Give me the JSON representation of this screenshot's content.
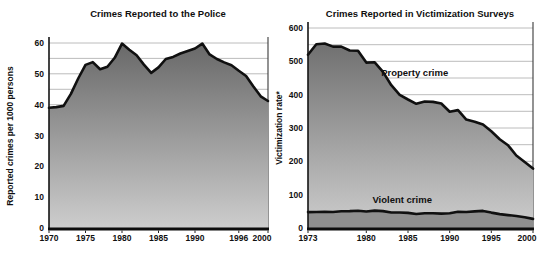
{
  "figure": {
    "background": "#ffffff"
  },
  "chart_data": [
    {
      "type": "area",
      "title": "Crimes Reported to the Police",
      "ylabel": "Reported crimes per 1000 persons",
      "xlabel": "",
      "x_range": [
        1970,
        2000
      ],
      "ylim": [
        0,
        60
      ],
      "y_ticks": [
        0,
        10,
        20,
        30,
        40,
        50,
        60
      ],
      "x_ticks": [
        1970,
        1975,
        1980,
        1985,
        1990,
        1996,
        2000
      ],
      "grid_step": 5,
      "grid_on": true,
      "grid_color": "#b4b4b4",
      "line_color": "#101010",
      "axis_color": "#0d0d0d",
      "series": [
        {
          "name": "Reported crimes",
          "x_start": 1970,
          "values": [
            39.0,
            39.2,
            39.6,
            43.5,
            48.5,
            52.9,
            53.8,
            51.5,
            52.3,
            55.2,
            59.8,
            57.8,
            56.0,
            53.0,
            50.3,
            52.1,
            54.8,
            55.5,
            56.6,
            57.4,
            58.2,
            59.8,
            56.3,
            54.8,
            53.7,
            52.8,
            51.0,
            49.3,
            45.9,
            42.7,
            41.2
          ],
          "fill": {
            "kind": "gradient",
            "top": "#686868",
            "bottom": "#cdcdcd"
          }
        }
      ],
      "annotations": []
    },
    {
      "type": "area",
      "title": "Crimes Reported in Victimization Surveys",
      "ylabel": "Victimization rate*",
      "xlabel": "",
      "x_range": [
        1973,
        2000
      ],
      "ylim": [
        0,
        600
      ],
      "y_ticks": [
        0,
        100,
        200,
        300,
        400,
        500,
        600
      ],
      "x_ticks": [
        1973,
        1980,
        1985,
        1990,
        1995,
        2000
      ],
      "grid_step": 50,
      "grid_on": true,
      "grid_color": "#b4b4b4",
      "line_color": "#101010",
      "axis_color": "#0d0d0d",
      "series": [
        {
          "name": "Property crime",
          "x_start": 1973,
          "values": [
            519.9,
            551.5,
            553.6,
            544.2,
            544.1,
            532.6,
            531.8,
            496.1,
            497.2,
            468.3,
            428.4,
            399.2,
            385.4,
            372.7,
            379.6,
            378.4,
            373.4,
            348.9,
            353.7,
            325.3,
            318.9,
            310.2,
            290.5,
            266.3,
            248.3,
            217.4,
            198.0,
            178.1
          ],
          "fill": {
            "kind": "gradient",
            "top": "#686868",
            "bottom": "#cdcdcd"
          }
        },
        {
          "name": "Violent crime",
          "x_start": 1973,
          "values": [
            47.7,
            48.0,
            48.4,
            48.0,
            50.4,
            50.6,
            51.7,
            49.4,
            52.3,
            50.7,
            46.5,
            46.4,
            45.2,
            42.0,
            44.0,
            44.1,
            43.3,
            44.1,
            48.8,
            47.9,
            49.9,
            51.2,
            46.1,
            41.6,
            38.8,
            36.0,
            32.1,
            27.4
          ],
          "fill": {
            "kind": "solid",
            "color": "#8f8f8f"
          }
        }
      ],
      "annotations": [
        {
          "text": "Property crime",
          "year": 1985.8,
          "value": 468
        },
        {
          "text": "Violent crime",
          "year": 1984.3,
          "value": 87
        }
      ]
    }
  ]
}
